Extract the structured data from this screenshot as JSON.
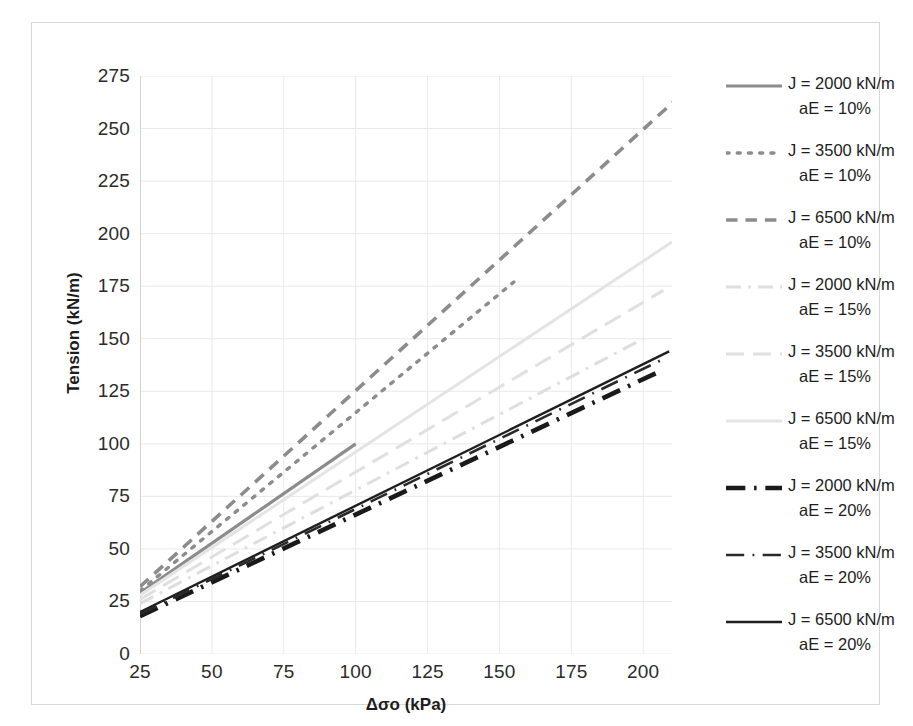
{
  "chart_data": {
    "type": "line",
    "title": "",
    "xlabel": "Δσo (kPa)",
    "ylabel": "Tension (kN/m)",
    "xlim": [
      25,
      210
    ],
    "ylim": [
      0,
      275
    ],
    "xticks": [
      25,
      50,
      75,
      100,
      125,
      150,
      175,
      200
    ],
    "yticks": [
      0,
      25,
      50,
      75,
      100,
      125,
      150,
      175,
      200,
      225,
      250,
      275
    ],
    "grid": true,
    "legend_position": "right",
    "series": [
      {
        "name": "J = 2000 kN/m aE = 10%",
        "label_line1": "J = 2000 kN/m",
        "label_line2": "aE = 10%",
        "style": "solid",
        "color": "#8c8c8c",
        "width": 3.2,
        "x": [
          25,
          100
        ],
        "y": [
          29,
          100
        ]
      },
      {
        "name": "J = 3500 kN/m aE = 10%",
        "label_line1": "J = 3500 kN/m",
        "label_line2": "aE = 10%",
        "style": "dotted",
        "color": "#8c8c8c",
        "width": 3.4,
        "x": [
          25,
          155
        ],
        "y": [
          30,
          177
        ]
      },
      {
        "name": "J = 6500 kN/m aE = 10%",
        "label_line1": "J = 6500 kN/m",
        "label_line2": "aE = 10%",
        "style": "dashed",
        "color": "#8c8c8c",
        "width": 3.6,
        "x": [
          25,
          218
        ],
        "y": [
          32,
          272
        ]
      },
      {
        "name": "J = 2000 kN/m aE = 15%",
        "label_line1": "J = 2000 kN/m",
        "label_line2": "aE = 15%",
        "style": "dash-dot",
        "color": "#dedede",
        "width": 3.0,
        "x": [
          25,
          200
        ],
        "y": [
          24,
          150
        ]
      },
      {
        "name": "J = 3500 kN/m aE = 15%",
        "label_line1": "J = 3500 kN/m",
        "label_line2": "aE = 15%",
        "style": "long-dash",
        "color": "#e0e0e0",
        "width": 3.0,
        "x": [
          25,
          207
        ],
        "y": [
          26,
          173
        ]
      },
      {
        "name": "J = 6500 kN/m aE = 15%",
        "label_line1": "J = 6500 kN/m",
        "label_line2": "aE = 15%",
        "style": "solid-light",
        "color": "#e4e4e4",
        "width": 3.0,
        "x": [
          25,
          210
        ],
        "y": [
          28,
          196
        ]
      },
      {
        "name": "J = 2000 kN/m aE = 20%",
        "label_line1": "J = 2000 kN/m",
        "label_line2": "aE = 20%",
        "style": "thick-dash-dot",
        "color": "#1a1a1a",
        "width": 4.6,
        "x": [
          25,
          205
        ],
        "y": [
          18,
          134
        ]
      },
      {
        "name": "J = 3500 kN/m aE = 20%",
        "label_line1": "J = 3500 kN/m",
        "label_line2": "aE = 20%",
        "style": "dash-dot-thin",
        "color": "#2a2a2a",
        "width": 2.6,
        "x": [
          25,
          208
        ],
        "y": [
          19,
          141
        ]
      },
      {
        "name": "J = 6500 kN/m aE = 20%",
        "label_line1": "J = 6500 kN/m",
        "label_line2": "aE = 20%",
        "style": "solid-dark",
        "color": "#1f1f1f",
        "width": 2.4,
        "x": [
          25,
          209
        ],
        "y": [
          20,
          144
        ]
      }
    ]
  },
  "axes": {
    "y_title": "Tension (kN/m)",
    "x_title": "Δσo (kPa)",
    "yticks": [
      "275",
      "250",
      "225",
      "200",
      "175",
      "150",
      "125",
      "100",
      "75",
      "50",
      "25",
      "0"
    ],
    "xticks": [
      "25",
      "50",
      "75",
      "100",
      "125",
      "150",
      "175",
      "200"
    ]
  },
  "legend": {
    "items": [
      {
        "line1": "J = 2000 kN/m",
        "line2": "aE = 10%"
      },
      {
        "line1": "J = 3500 kN/m",
        "line2": "aE = 10%"
      },
      {
        "line1": "J = 6500 kN/m",
        "line2": "aE = 10%"
      },
      {
        "line1": "J = 2000 kN/m",
        "line2": "aE = 15%"
      },
      {
        "line1": "J = 3500 kN/m",
        "line2": "aE = 15%"
      },
      {
        "line1": "J = 6500 kN/m",
        "line2": "aE = 15%"
      },
      {
        "line1": "J = 2000 kN/m",
        "line2": "aE = 20%"
      },
      {
        "line1": "J = 3500 kN/m",
        "line2": "aE = 20%"
      },
      {
        "line1": "J = 6500 kN/m",
        "line2": "aE = 20%"
      }
    ]
  },
  "colors": {
    "grid": "#e9e9e9",
    "frame": "#d8d8d8",
    "text": "#2b2b2b",
    "gray_series": "#8c8c8c",
    "light_series": "#e0e0e0",
    "dark_series": "#1a1a1a"
  }
}
